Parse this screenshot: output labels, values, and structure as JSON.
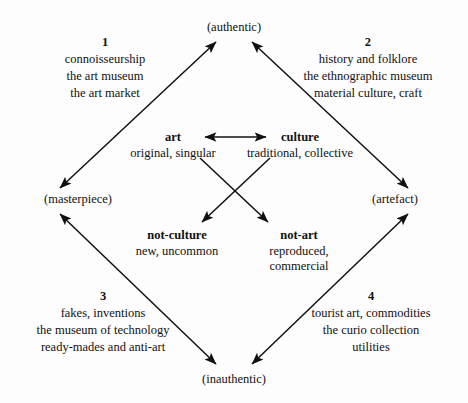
{
  "diagram": {
    "type": "semiotic-square",
    "background_color": "#fdfdfd",
    "ink_color": "#111111",
    "poles": {
      "top": "(authentic)",
      "left": "(masterpiece)",
      "right": "(artefact)",
      "bottom": "(inauthentic)"
    },
    "terms": {
      "art": {
        "head": "art",
        "sub": "original, singular"
      },
      "culture": {
        "head": "culture",
        "sub": "traditional, collective"
      },
      "not_culture": {
        "head": "not-culture",
        "sub": "new, uncommon"
      },
      "not_art": {
        "head": "not-art",
        "sub_line1": "reproduced,",
        "sub_line2": "commercial"
      }
    },
    "quadrants": [
      {
        "number": "1",
        "lines": [
          "connoisseurship",
          "the art museum",
          "the art market"
        ]
      },
      {
        "number": "2",
        "lines": [
          "history and folklore",
          "the ethnographic museum",
          "material culture, craft"
        ]
      },
      {
        "number": "3",
        "lines": [
          "fakes, inventions",
          "the museum of technology",
          "ready-mades and anti-art"
        ]
      },
      {
        "number": "4",
        "lines": [
          "tourist art, commodities",
          "the curio collection",
          "utilities"
        ]
      }
    ],
    "connectors": [
      {
        "name": "art-culture-axis",
        "from": "art",
        "to": "culture",
        "style": "double-headed"
      },
      {
        "name": "art-to-not-art",
        "from": "art",
        "to": "not-art",
        "style": "single-headed"
      },
      {
        "name": "culture-to-not-culture",
        "from": "culture",
        "to": "not-culture",
        "style": "single-headed"
      },
      {
        "name": "masterpiece-authentic-edge",
        "from": "(masterpiece)",
        "to": "(authentic)",
        "style": "double-headed"
      },
      {
        "name": "authentic-artefact-edge",
        "from": "(authentic)",
        "to": "(artefact)",
        "style": "double-headed"
      },
      {
        "name": "masterpiece-inauthentic-edge",
        "from": "(masterpiece)",
        "to": "(inauthentic)",
        "style": "double-headed"
      },
      {
        "name": "inauthentic-artefact-edge",
        "from": "(inauthentic)",
        "to": "(artefact)",
        "style": "double-headed"
      }
    ]
  }
}
